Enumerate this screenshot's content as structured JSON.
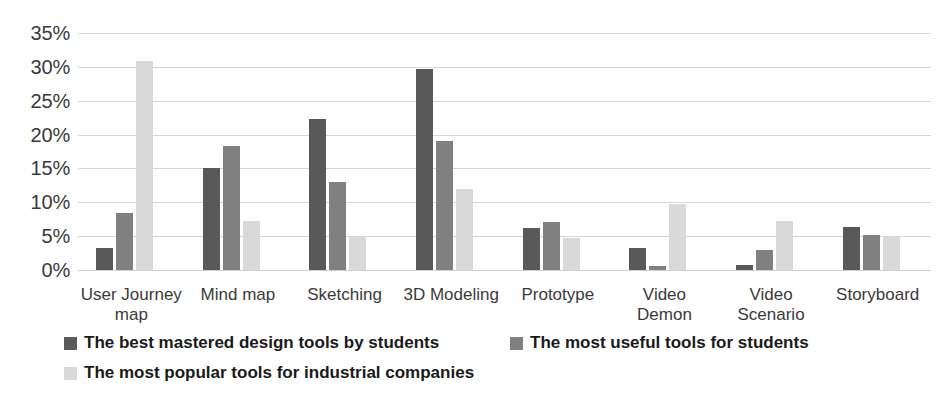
{
  "chart_data": {
    "type": "bar",
    "title": "",
    "subtitle": "",
    "xlabel": "",
    "ylabel": "",
    "ylim": [
      0,
      35
    ],
    "ytick_values": [
      0,
      5,
      10,
      15,
      20,
      25,
      30,
      35
    ],
    "ytick_labels": [
      "0%",
      "5%",
      "10%",
      "15%",
      "20%",
      "25%",
      "30%",
      "35%"
    ],
    "grid": true,
    "legend_position": "bottom",
    "categories": [
      "User Journey map",
      "Mind map",
      "Sketching",
      "3D Modeling",
      "Prototype",
      "Video Demon",
      "Video Scenario",
      "Storyboard"
    ],
    "series": [
      {
        "name": "The best mastered design tools by students",
        "color": "#595959",
        "values": [
          3.2,
          15.0,
          22.3,
          29.7,
          6.2,
          3.2,
          0.8,
          6.4
        ]
      },
      {
        "name": "The most useful tools for students",
        "color": "#808080",
        "values": [
          8.4,
          18.3,
          13.0,
          19.1,
          7.1,
          0.6,
          3.0,
          5.2
        ]
      },
      {
        "name": "The most popular tools for industrial companies",
        "color": "#d9d9d9",
        "values": [
          30.8,
          7.2,
          4.9,
          12.0,
          4.8,
          9.7,
          7.3,
          5.0
        ]
      }
    ]
  },
  "colors": {
    "series_dark": "#595959",
    "series_mid": "#808080",
    "series_light": "#d9d9d9",
    "gridline": "#d6d6d6",
    "text": "#262626",
    "background": "#ffffff"
  }
}
